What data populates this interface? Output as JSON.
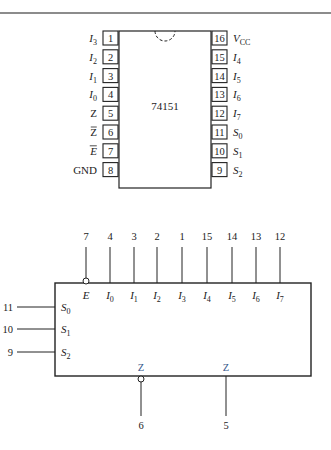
{
  "figure": {
    "top_rule": true,
    "package": {
      "part_number": "74151",
      "left_pins": [
        {
          "num": "1",
          "name": "I",
          "sub": "3"
        },
        {
          "num": "2",
          "name": "I",
          "sub": "2"
        },
        {
          "num": "3",
          "name": "I",
          "sub": "1"
        },
        {
          "num": "4",
          "name": "I",
          "sub": "0"
        },
        {
          "num": "5",
          "name": "Z",
          "sub": "",
          "bar": false
        },
        {
          "num": "6",
          "name": "Z",
          "sub": "",
          "bar": true
        },
        {
          "num": "7",
          "name": "E",
          "sub": "",
          "bar": true
        },
        {
          "num": "8",
          "name": "GND",
          "sub": ""
        }
      ],
      "right_pins": [
        {
          "num": "16",
          "name": "V",
          "sub": "CC"
        },
        {
          "num": "15",
          "name": "I",
          "sub": "4"
        },
        {
          "num": "14",
          "name": "I",
          "sub": "5"
        },
        {
          "num": "13",
          "name": "I",
          "sub": "6"
        },
        {
          "num": "12",
          "name": "I",
          "sub": "7"
        },
        {
          "num": "11",
          "name": "S",
          "sub": "0"
        },
        {
          "num": "10",
          "name": "S",
          "sub": "1"
        },
        {
          "num": "9",
          "name": "S",
          "sub": "2"
        }
      ]
    },
    "logic_symbol": {
      "top_inputs": [
        {
          "pin": "7",
          "name": "E",
          "sub": "",
          "inverted": true
        },
        {
          "pin": "4",
          "name": "I",
          "sub": "0"
        },
        {
          "pin": "3",
          "name": "I",
          "sub": "1"
        },
        {
          "pin": "2",
          "name": "I",
          "sub": "2"
        },
        {
          "pin": "1",
          "name": "I",
          "sub": "3"
        },
        {
          "pin": "15",
          "name": "I",
          "sub": "4"
        },
        {
          "pin": "14",
          "name": "I",
          "sub": "5"
        },
        {
          "pin": "13",
          "name": "I",
          "sub": "6"
        },
        {
          "pin": "12",
          "name": "I",
          "sub": "7"
        }
      ],
      "select_inputs": [
        {
          "pin": "11",
          "name": "S",
          "sub": "0"
        },
        {
          "pin": "10",
          "name": "S",
          "sub": "1"
        },
        {
          "pin": "9",
          "name": "S",
          "sub": "2"
        }
      ],
      "outputs": [
        {
          "pin": "6",
          "name": "Z",
          "inverted": true
        },
        {
          "pin": "5",
          "name": "Z",
          "inverted": false
        }
      ]
    }
  }
}
